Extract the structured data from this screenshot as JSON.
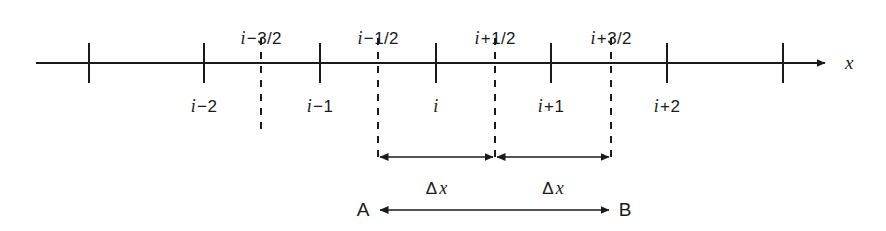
{
  "figure": {
    "axis": {
      "name": "x",
      "start_x": 36,
      "end_x": 833,
      "y": 63,
      "color": "#1a1a1a"
    },
    "nodes": [
      {
        "x": 89,
        "label": ""
      },
      {
        "x": 204,
        "label_i": "i",
        "label_op": "−",
        "label_num": "2"
      },
      {
        "x": 320,
        "label_i": "i",
        "label_op": "−",
        "label_num": "1"
      },
      {
        "x": 436,
        "label_i": "i",
        "label_op": "",
        "label_num": ""
      },
      {
        "x": 551,
        "label_i": "i",
        "label_op": "+",
        "label_num": "1"
      },
      {
        "x": 667,
        "label_i": "i",
        "label_op": "+",
        "label_num": "2"
      },
      {
        "x": 783,
        "label": ""
      }
    ],
    "faces": [
      {
        "x": 261,
        "label_i": "i",
        "label_op": "−",
        "label_num": "3/2",
        "top": 38,
        "bottom": 133
      },
      {
        "x": 378,
        "label_i": "i",
        "label_op": "−",
        "label_num": "1/2",
        "top": 38,
        "bottom": 157
      },
      {
        "x": 495,
        "label_i": "i",
        "label_op": "+",
        "label_num": "1/2",
        "top": 38,
        "bottom": 157
      },
      {
        "x": 611,
        "label_i": "i",
        "label_op": "+",
        "label_num": "3/2",
        "top": 38,
        "bottom": 157
      }
    ],
    "spacings": [
      {
        "from_x": 378,
        "to_x": 495,
        "y": 157,
        "symbol": "Δ",
        "variable": "x",
        "label_y": 178
      },
      {
        "from_x": 495,
        "to_x": 611,
        "y": 157,
        "symbol": "Δ",
        "variable": "x",
        "label_y": 178
      }
    ],
    "extent": {
      "from_x": 378,
      "to_x": 611,
      "y": 210,
      "start_label": "A",
      "end_label": "B",
      "start_label_x": 363,
      "end_label_x": 625
    },
    "labels_above_y": 28,
    "labels_below_y": 96
  }
}
